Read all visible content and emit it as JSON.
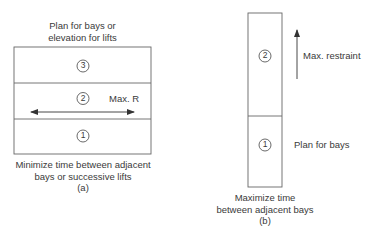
{
  "diagram_a": {
    "title_line1": "Plan for bays or",
    "title_line2": "elevation for lifts",
    "cells": [
      {
        "number": "3"
      },
      {
        "number": "2"
      },
      {
        "number": "1"
      }
    ],
    "arrow_label": "Max. R",
    "caption_line1": "Minimize time between adjacent",
    "caption_line2": "bays or successive lifts",
    "caption_tag": "(a)"
  },
  "diagram_b": {
    "cells": [
      {
        "number": "2"
      },
      {
        "number": "1"
      }
    ],
    "arrow_label": "Max. restraint",
    "side_label": "Plan for bays",
    "caption_line1": "Maximize time",
    "caption_line2": "between adjacent bays",
    "caption_tag": "(b)"
  },
  "colors": {
    "line": "#555555",
    "text": "#3a3a3a"
  }
}
